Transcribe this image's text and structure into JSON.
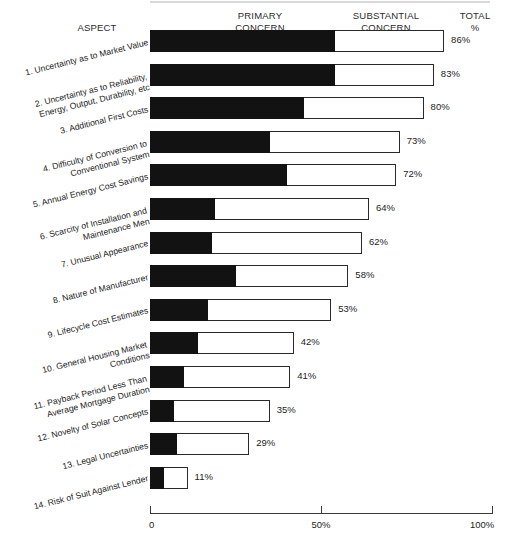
{
  "headers": {
    "aspect": "ASPECT",
    "primary": "PRIMARY\nCONCERN",
    "substantial": "SUBSTANTIAL\nCONCERN",
    "total": "TOTAL\n%"
  },
  "axis": {
    "ticks": [
      "0",
      "50%",
      "100%"
    ],
    "tick_values": [
      0,
      50,
      100
    ]
  },
  "chart_data": {
    "type": "bar",
    "orientation": "horizontal",
    "title": "",
    "subtitle": "",
    "xlabel": "",
    "ylabel": "ASPECT",
    "xlim": [
      0,
      100
    ],
    "grid": false,
    "legend_position": "top",
    "stacked": true,
    "categories": [
      "1. Uncertainty as to Market Value",
      "2. Uncertainty as to Reliability,\nEnergy, Output, Durability, etc",
      "3. Additional First Costs",
      "4. Difficulty of Conversion to\nConventional System",
      "5. Annual Energy Cost Savings",
      "6. Scarcity of Installation and\nMaintenance Men",
      "7. Unusual Appearance",
      "8. Nature of Manufacturer",
      "9. Lifecycle Cost Estimates",
      "10. General Housing Market\nConditions",
      "11. Payback Period Less Than\nAverage Mortgage Duration",
      "12. Novelty of Solar Concepts",
      "13. Legal Uncertainties",
      "14. Risk of Suit Against Lender"
    ],
    "series": [
      {
        "name": "PRIMARY CONCERN",
        "color": "#121212",
        "values": [
          54,
          54,
          45,
          35,
          40,
          19,
          18,
          25,
          17,
          14,
          10,
          7,
          8,
          4
        ]
      },
      {
        "name": "SUBSTANTIAL CONCERN",
        "color": "#ffffff",
        "values": [
          32,
          29,
          35,
          38,
          32,
          45,
          44,
          33,
          36,
          28,
          31,
          28,
          21,
          7
        ]
      }
    ],
    "totals": [
      86,
      83,
      80,
      73,
      72,
      64,
      62,
      58,
      53,
      42,
      41,
      35,
      29,
      11
    ],
    "total_labels": [
      "86%",
      "83%",
      "80%",
      "73%",
      "72%",
      "64%",
      "62%",
      "58%",
      "53%",
      "42%",
      "41%",
      "35%",
      "29%",
      "11%"
    ]
  }
}
